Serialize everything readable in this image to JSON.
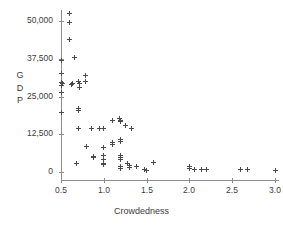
{
  "chart_data": {
    "type": "scatter",
    "title": "",
    "xlabel": "Crowdedness",
    "ylabel": "GDP",
    "ylabel_chars": [
      "G",
      "D",
      "P"
    ],
    "xlim": [
      0.42,
      3.06
    ],
    "ylim": [
      -2200,
      54000
    ],
    "grid": false,
    "legend": false,
    "marker": "plus",
    "marker_color": "#4a4a4a",
    "axis_color": "#8d8d8d",
    "xticks": [
      0.5,
      1.0,
      1.5,
      2.0,
      2.5,
      3.0
    ],
    "xtick_labels": [
      "0.5",
      "1.0",
      "1.5",
      "2.0",
      "2.5",
      "3.0"
    ],
    "yticks": [
      0,
      12500,
      25000,
      37500,
      50000
    ],
    "ytick_labels": [
      "0",
      "12,500",
      "25,000",
      "37,500",
      "50,000"
    ],
    "points": [
      {
        "x": 0.5,
        "y": 37000
      },
      {
        "x": 0.5,
        "y": 32500
      },
      {
        "x": 0.5,
        "y": 29500
      },
      {
        "x": 0.5,
        "y": 28800
      },
      {
        "x": 0.5,
        "y": 26500
      },
      {
        "x": 0.5,
        "y": 19800
      },
      {
        "x": 0.52,
        "y": 29300
      },
      {
        "x": 0.6,
        "y": 52500
      },
      {
        "x": 0.6,
        "y": 49500
      },
      {
        "x": 0.6,
        "y": 44000
      },
      {
        "x": 0.62,
        "y": 29000
      },
      {
        "x": 0.63,
        "y": 29300
      },
      {
        "x": 0.66,
        "y": 38000
      },
      {
        "x": 0.7,
        "y": 21000
      },
      {
        "x": 0.7,
        "y": 20300
      },
      {
        "x": 0.7,
        "y": 30000
      },
      {
        "x": 0.71,
        "y": 29300
      },
      {
        "x": 0.72,
        "y": 28000
      },
      {
        "x": 0.7,
        "y": 14500
      },
      {
        "x": 0.68,
        "y": 2800
      },
      {
        "x": 0.78,
        "y": 32000
      },
      {
        "x": 0.79,
        "y": 30000
      },
      {
        "x": 0.8,
        "y": 8500
      },
      {
        "x": 0.86,
        "y": 14500
      },
      {
        "x": 0.88,
        "y": 5200
      },
      {
        "x": 0.88,
        "y": 4800
      },
      {
        "x": 0.95,
        "y": 14500
      },
      {
        "x": 1.0,
        "y": 14500
      },
      {
        "x": 1.0,
        "y": 8000
      },
      {
        "x": 1.0,
        "y": 5500
      },
      {
        "x": 1.0,
        "y": 4300
      },
      {
        "x": 1.0,
        "y": 2800
      },
      {
        "x": 1.0,
        "y": 2500
      },
      {
        "x": 1.1,
        "y": 17200
      },
      {
        "x": 1.1,
        "y": 9700
      },
      {
        "x": 1.1,
        "y": 9000
      },
      {
        "x": 1.18,
        "y": 17800
      },
      {
        "x": 1.2,
        "y": 17200
      },
      {
        "x": 1.2,
        "y": 16800
      },
      {
        "x": 1.2,
        "y": 10800
      },
      {
        "x": 1.2,
        "y": 10000
      },
      {
        "x": 1.2,
        "y": 5400
      },
      {
        "x": 1.2,
        "y": 4700
      },
      {
        "x": 1.2,
        "y": 4000
      },
      {
        "x": 1.2,
        "y": 1800
      },
      {
        "x": 1.2,
        "y": 1200
      },
      {
        "x": 1.25,
        "y": 15500
      },
      {
        "x": 1.28,
        "y": 2800
      },
      {
        "x": 1.3,
        "y": 2300
      },
      {
        "x": 1.3,
        "y": 1500
      },
      {
        "x": 1.32,
        "y": 14500
      },
      {
        "x": 1.38,
        "y": 1800
      },
      {
        "x": 1.48,
        "y": 800
      },
      {
        "x": 1.5,
        "y": 500
      },
      {
        "x": 1.58,
        "y": 3200
      },
      {
        "x": 2.0,
        "y": 1800
      },
      {
        "x": 2.0,
        "y": 1200
      },
      {
        "x": 2.06,
        "y": 800
      },
      {
        "x": 2.14,
        "y": 1000
      },
      {
        "x": 2.2,
        "y": 900
      },
      {
        "x": 2.6,
        "y": 800
      },
      {
        "x": 2.68,
        "y": 700
      },
      {
        "x": 3.0,
        "y": 500
      }
    ]
  },
  "axes": {
    "x_axis_title": "Crowdedness",
    "y_axis_title": "GDP"
  }
}
